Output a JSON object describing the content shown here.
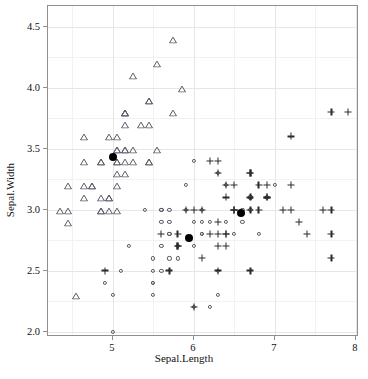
{
  "chart_data": {
    "type": "scatter",
    "title": "",
    "xlabel": "Sepal.Length",
    "ylabel": "Sepal.Width",
    "xlim": [
      4.2,
      8.04
    ],
    "ylim": [
      1.955,
      4.67
    ],
    "xticks": [
      5,
      6,
      7,
      8
    ],
    "xticklabels": [
      "5",
      "6",
      "7",
      "8"
    ],
    "yticks": [
      2.0,
      2.5,
      3.0,
      3.5,
      4.0,
      4.5
    ],
    "yticklabels": [
      "2.0",
      "2.5",
      "3.0",
      "3.5",
      "4.0",
      "4.5"
    ],
    "grid": true,
    "legend": "none",
    "background": "#ffffff",
    "panel_border": "#8f8f8f",
    "gridline_color": "#e6e6e6",
    "series": [
      {
        "name": "setosa",
        "marker": "open-triangle",
        "color": "#5a5a66",
        "points": [
          [
            5.1,
            3.5
          ],
          [
            4.9,
            3.0
          ],
          [
            4.7,
            3.2
          ],
          [
            4.6,
            3.1
          ],
          [
            5.0,
            3.6
          ],
          [
            5.4,
            3.9
          ],
          [
            4.6,
            3.4
          ],
          [
            5.0,
            3.4
          ],
          [
            4.4,
            2.9
          ],
          [
            4.9,
            3.1
          ],
          [
            5.4,
            3.7
          ],
          [
            4.8,
            3.4
          ],
          [
            4.8,
            3.0
          ],
          [
            4.3,
            3.0
          ],
          [
            5.8,
            4.0
          ],
          [
            5.7,
            4.4
          ],
          [
            5.4,
            3.9
          ],
          [
            5.1,
            3.5
          ],
          [
            5.7,
            3.8
          ],
          [
            5.1,
            3.8
          ],
          [
            5.4,
            3.4
          ],
          [
            5.1,
            3.7
          ],
          [
            4.6,
            3.6
          ],
          [
            5.1,
            3.3
          ],
          [
            4.8,
            3.4
          ],
          [
            5.0,
            3.0
          ],
          [
            5.0,
            3.4
          ],
          [
            5.2,
            3.5
          ],
          [
            5.2,
            3.4
          ],
          [
            4.7,
            3.2
          ],
          [
            4.8,
            3.1
          ],
          [
            5.4,
            3.4
          ],
          [
            5.2,
            4.1
          ],
          [
            5.5,
            4.2
          ],
          [
            4.9,
            3.1
          ],
          [
            5.0,
            3.2
          ],
          [
            5.5,
            3.5
          ],
          [
            4.9,
            3.6
          ],
          [
            4.4,
            3.0
          ],
          [
            5.1,
            3.4
          ],
          [
            5.0,
            3.5
          ],
          [
            4.5,
            2.3
          ],
          [
            4.4,
            3.2
          ],
          [
            5.0,
            3.5
          ],
          [
            5.1,
            3.8
          ],
          [
            4.8,
            3.0
          ],
          [
            5.1,
            3.8
          ],
          [
            4.6,
            3.2
          ],
          [
            5.3,
            3.7
          ],
          [
            5.0,
            3.3
          ]
        ]
      },
      {
        "name": "versicolor",
        "marker": "open-circle",
        "color": "#5a5a66",
        "points": [
          [
            7.0,
            3.2
          ],
          [
            6.4,
            3.2
          ],
          [
            6.9,
            3.1
          ],
          [
            5.5,
            2.3
          ],
          [
            6.5,
            2.8
          ],
          [
            5.7,
            2.8
          ],
          [
            6.3,
            3.3
          ],
          [
            4.9,
            2.4
          ],
          [
            6.6,
            2.9
          ],
          [
            5.2,
            2.7
          ],
          [
            5.0,
            2.0
          ],
          [
            5.9,
            3.0
          ],
          [
            6.0,
            2.2
          ],
          [
            6.1,
            2.9
          ],
          [
            5.6,
            2.9
          ],
          [
            6.7,
            3.1
          ],
          [
            5.6,
            3.0
          ],
          [
            5.8,
            2.7
          ],
          [
            6.2,
            2.2
          ],
          [
            5.6,
            2.5
          ],
          [
            5.9,
            3.2
          ],
          [
            6.1,
            2.8
          ],
          [
            6.3,
            2.5
          ],
          [
            6.1,
            2.8
          ],
          [
            6.4,
            2.9
          ],
          [
            6.6,
            3.0
          ],
          [
            6.8,
            2.8
          ],
          [
            6.7,
            3.0
          ],
          [
            6.0,
            2.9
          ],
          [
            5.7,
            2.6
          ],
          [
            5.5,
            2.4
          ],
          [
            5.5,
            2.4
          ],
          [
            5.8,
            2.7
          ],
          [
            6.0,
            2.7
          ],
          [
            5.4,
            3.0
          ],
          [
            6.0,
            3.4
          ],
          [
            6.7,
            3.1
          ],
          [
            6.3,
            2.3
          ],
          [
            5.6,
            3.0
          ],
          [
            5.5,
            2.5
          ],
          [
            5.5,
            2.6
          ],
          [
            6.1,
            3.0
          ],
          [
            5.8,
            2.6
          ],
          [
            5.0,
            2.3
          ],
          [
            5.6,
            2.7
          ],
          [
            5.7,
            3.0
          ],
          [
            5.7,
            2.9
          ],
          [
            6.2,
            2.9
          ],
          [
            5.1,
            2.5
          ],
          [
            5.7,
            2.8
          ]
        ]
      },
      {
        "name": "virginica",
        "marker": "plus",
        "color": "#2a2a2a",
        "points": [
          [
            6.3,
            3.3
          ],
          [
            5.8,
            2.7
          ],
          [
            7.1,
            3.0
          ],
          [
            6.3,
            2.9
          ],
          [
            6.5,
            3.0
          ],
          [
            7.6,
            3.0
          ],
          [
            4.9,
            2.5
          ],
          [
            7.3,
            2.9
          ],
          [
            6.7,
            2.5
          ],
          [
            7.2,
            3.6
          ],
          [
            6.5,
            3.2
          ],
          [
            6.4,
            2.7
          ],
          [
            6.8,
            3.0
          ],
          [
            5.7,
            2.5
          ],
          [
            5.8,
            2.8
          ],
          [
            6.4,
            3.2
          ],
          [
            6.5,
            3.0
          ],
          [
            7.7,
            3.8
          ],
          [
            7.7,
            2.6
          ],
          [
            6.0,
            2.2
          ],
          [
            6.9,
            3.2
          ],
          [
            5.6,
            2.8
          ],
          [
            7.7,
            2.8
          ],
          [
            6.3,
            2.7
          ],
          [
            6.7,
            3.3
          ],
          [
            7.2,
            3.2
          ],
          [
            6.2,
            2.8
          ],
          [
            6.1,
            3.0
          ],
          [
            6.4,
            2.8
          ],
          [
            7.2,
            3.0
          ],
          [
            7.4,
            2.8
          ],
          [
            7.9,
            3.8
          ],
          [
            6.4,
            2.8
          ],
          [
            6.3,
            2.8
          ],
          [
            6.1,
            2.6
          ],
          [
            7.7,
            3.0
          ],
          [
            6.3,
            3.4
          ],
          [
            6.4,
            3.1
          ],
          [
            6.0,
            3.0
          ],
          [
            6.9,
            3.1
          ],
          [
            6.7,
            3.1
          ],
          [
            6.9,
            3.1
          ],
          [
            5.8,
            2.7
          ],
          [
            6.8,
            3.2
          ],
          [
            6.7,
            3.3
          ],
          [
            6.7,
            3.0
          ],
          [
            6.3,
            2.5
          ],
          [
            6.5,
            3.0
          ],
          [
            6.2,
            3.4
          ],
          [
            5.9,
            3.0
          ]
        ]
      },
      {
        "name": "centroids",
        "marker": "filled-circle",
        "color": "#000000",
        "points": [
          [
            5.006,
            3.428
          ],
          [
            5.936,
            2.77
          ],
          [
            6.588,
            2.974
          ]
        ]
      }
    ]
  }
}
